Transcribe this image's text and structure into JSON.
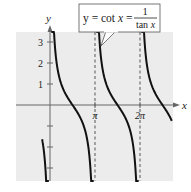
{
  "chart_data": {
    "type": "line",
    "xlabel": "x",
    "ylabel": "y",
    "x_ticks": [
      {
        "label": "π",
        "value": 3.14159
      },
      {
        "label": "2π",
        "value": 6.28319
      }
    ],
    "y_ticks": [
      {
        "label": "1",
        "value": 1
      },
      {
        "label": "2",
        "value": 2
      },
      {
        "label": "3",
        "value": 3
      },
      {
        "label": "",
        "value": -1
      },
      {
        "label": "",
        "value": -2
      },
      {
        "label": "",
        "value": -3
      }
    ],
    "xlim": [
      -0.75,
      8.6
    ],
    "ylim": [
      -3.6,
      3.5
    ],
    "grid": false,
    "background": "#ececec",
    "asymptotes": [
      {
        "x": 0,
        "style": "axis"
      },
      {
        "x": 3.14159,
        "style": "dashed"
      },
      {
        "x": 6.28319,
        "style": "dashed"
      }
    ],
    "series": [
      {
        "name": "cot x",
        "function": "cot(x)",
        "color": "#111111",
        "branches": [
          {
            "x_range": [
              -0.55,
              -0.08
            ]
          },
          {
            "x_range": [
              0.09,
              3.05
            ]
          },
          {
            "x_range": [
              3.23,
              6.19
            ]
          },
          {
            "x_range": [
              6.37,
              8.5
            ]
          }
        ]
      }
    ],
    "annotation": {
      "lhs": "y = cot x =",
      "numerator": "1",
      "denominator": "tan x"
    }
  },
  "axes": {
    "x_label": "x",
    "y_label": "y",
    "x_tick_labels": [
      "π",
      "2π"
    ],
    "y_tick_labels": [
      "1",
      "2",
      "3"
    ]
  }
}
